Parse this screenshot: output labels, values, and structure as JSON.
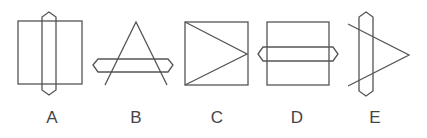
{
  "figure": {
    "type": "visual-reasoning-options",
    "stroke_color": "#555555",
    "label_color": "#444444",
    "options": [
      {
        "label": "A",
        "description": "Square with a vertical hexagonal bar crossing through its center, extending above and below",
        "label_x": 52
      },
      {
        "label": "B",
        "description": "Open triangle (two lines meeting at an apex) crossed by a horizontal hexagonal bar",
        "label_x": 136
      },
      {
        "label": "C",
        "description": "Square with two lines from the left corners meeting at the midpoint of the right side",
        "label_x": 217
      },
      {
        "label": "D",
        "description": "Square with a horizontal hexagonal bar crossing through its middle, extending left and right",
        "label_x": 297
      },
      {
        "label": "E",
        "description": "Open triangle (two lines meeting at a point on the right) crossed by a vertical hexagonal bar",
        "label_x": 375
      }
    ]
  }
}
